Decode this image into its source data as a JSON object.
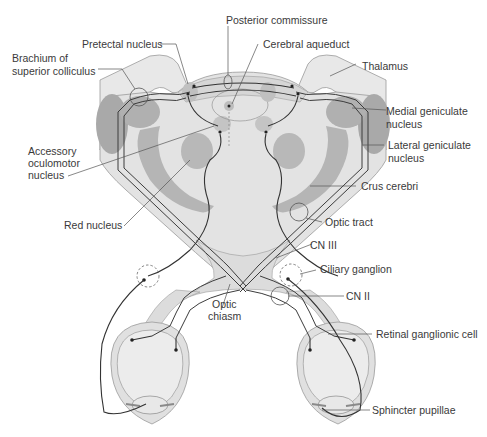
{
  "diagram": {
    "colors": {
      "tissue_light": "#e6e6e6",
      "tissue_mid": "#d2d2d2",
      "nucleus_dark": "#a9a9a9",
      "outline": "#9a9a9a",
      "nerve": "#333333",
      "label": "#3a3a3a"
    },
    "labels": {
      "posterior_commissure": "Posterior commissure",
      "pretectal_nucleus": "Pretectal nucleus",
      "cerebral_aqueduct": "Cerebral aqueduct",
      "brachium_line1": "Brachium of",
      "brachium_line2": "superior colliculus",
      "thalamus": "Thalamus",
      "medial_geniculate_line1": "Medial geniculate",
      "medial_geniculate_line2": "nucleus",
      "accessory_line1": "Accessory",
      "accessory_line2": "oculomotor",
      "accessory_line3": "nucleus",
      "lateral_geniculate_line1": "Lateral geniculate",
      "lateral_geniculate_line2": "nucleus",
      "crus_cerebri": "Crus cerebri",
      "red_nucleus": "Red nucleus",
      "optic_tract": "Optic tract",
      "cn_iii": "CN III",
      "ciliary_ganglion": "Ciliary ganglion",
      "cn_ii": "CN II",
      "optic_chiasm_line1": "Optic",
      "optic_chiasm_line2": "chiasm",
      "retinal_ganglionic_cell": "Retinal ganglionic cell",
      "sphincter_pupillae": "Sphincter pupillae"
    }
  }
}
